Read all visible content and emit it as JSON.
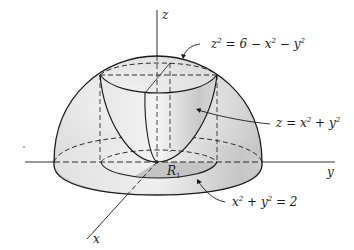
{
  "diagram": {
    "type": "3d-surface-illustration",
    "axes": {
      "z_label": "z",
      "y_label": "y",
      "x_label": "x"
    },
    "surfaces": [
      {
        "id": "hemisphere",
        "label_base": "z",
        "label_exp": "2",
        "label_rest": " = 6 − x",
        "label_exp2": "2",
        "label_rest2": " − y",
        "label_exp3": "2"
      },
      {
        "id": "paraboloid",
        "label_base": "z = x",
        "label_exp": "2",
        "label_rest": " + y",
        "label_exp2": "2"
      }
    ],
    "region": {
      "label": "R",
      "label_sub": "1"
    },
    "boundary_curve": {
      "label_base": "x",
      "label_exp": "2",
      "label_rest": " + y",
      "label_exp2": "2",
      "label_rest2": " = 2"
    },
    "colors": {
      "line": "#1a1a1a",
      "shade_light": "#f2f2f2",
      "shade_mid": "#d8d8d8",
      "shade_dark": "#b8b8b8",
      "region_fill": "#c4c4c4"
    }
  }
}
